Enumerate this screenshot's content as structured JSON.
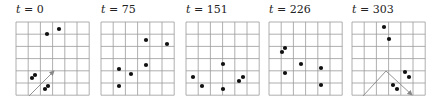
{
  "figure": {
    "grid": {
      "cols": 6,
      "rows": 6,
      "cell": 12.2,
      "top": 22,
      "line_color": "#9a9a9a",
      "border_color": "#8a8a8a"
    },
    "point_color": "#111111",
    "arrow_color": "#888888",
    "panels": [
      {
        "label_var": "t",
        "label_value": "= 0",
        "left": 16,
        "points": [
          [
            47,
            34
          ],
          [
            59,
            29
          ],
          [
            32,
            78
          ],
          [
            35,
            75
          ],
          [
            45,
            89
          ],
          [
            48,
            86
          ]
        ],
        "lines": [
          {
            "x1": 29,
            "y1": 96,
            "x2": 54,
            "y2": 71,
            "arrow": true
          }
        ]
      },
      {
        "label_var": "t",
        "label_value": "= 75",
        "left": 101,
        "points": [
          [
            146,
            40
          ],
          [
            167,
            44
          ],
          [
            146,
            65
          ],
          [
            119,
            69
          ],
          [
            131,
            74
          ],
          [
            119,
            86
          ]
        ],
        "lines": []
      },
      {
        "label_var": "t",
        "label_value": "= 151",
        "left": 186,
        "points": [
          [
            223,
            64
          ],
          [
            193,
            77
          ],
          [
            202,
            86
          ],
          [
            223,
            89
          ],
          [
            239,
            81
          ],
          [
            243,
            77
          ]
        ],
        "lines": []
      },
      {
        "label_var": "t",
        "label_value": "= 226",
        "left": 269,
        "points": [
          [
            282,
            52
          ],
          [
            285,
            48
          ],
          [
            301,
            64
          ],
          [
            285,
            73
          ],
          [
            321,
            68
          ],
          [
            321,
            85
          ]
        ],
        "lines": []
      },
      {
        "label_var": "t",
        "label_value": "= 303",
        "left": 352,
        "points": [
          [
            384,
            27
          ],
          [
            389,
            39
          ],
          [
            405,
            72
          ],
          [
            409,
            77
          ],
          [
            393,
            85
          ],
          [
            397,
            89
          ]
        ],
        "lines": [
          {
            "x1": 363,
            "y1": 96,
            "x2": 386,
            "y2": 71,
            "arrow": false
          },
          {
            "x1": 386,
            "y1": 71,
            "x2": 412,
            "y2": 95,
            "arrow": true
          }
        ]
      }
    ]
  }
}
